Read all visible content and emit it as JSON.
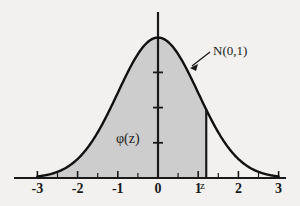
{
  "chart_data": {
    "type": "area",
    "title": "",
    "subtitle": "",
    "xlabel": "",
    "ylabel": "",
    "xlim": [
      -3.45,
      3.45
    ],
    "ylim": [
      0,
      0.47
    ],
    "grid": false,
    "legend": "none",
    "distribution": "standard normal",
    "mean": 0,
    "sd": 1,
    "curve_label": "N(0,1)",
    "density_label": "φ(z)",
    "z_label": "z",
    "z_value": 1.2,
    "shaded_region": {
      "from": -3.45,
      "to": 1.2,
      "meaning": "cumulative probability up to z",
      "color": "#cdcdcd"
    },
    "x_major_ticks": [
      -3,
      -2,
      -1,
      0,
      1,
      2,
      3
    ],
    "x_major_tick_labels": [
      "-3",
      "-2",
      "-1",
      "0",
      "1",
      "2",
      "3"
    ],
    "x_minor_ticks": [
      -2.5,
      -1.5,
      -0.5,
      0.5,
      1.5,
      2.5
    ],
    "y_ticks": [
      0.1,
      0.2,
      0.3
    ],
    "y_tick_labels": [
      "",
      "",
      ""
    ],
    "curve_domain": [
      -3,
      3
    ],
    "curve_points": {
      "x": [
        -3,
        -2.8,
        -2.6,
        -2.4,
        -2.2,
        -2,
        -1.8,
        -1.6,
        -1.4,
        -1.2,
        -1,
        -0.8,
        -0.6,
        -0.4,
        -0.2,
        0,
        0.2,
        0.4,
        0.6,
        0.8,
        1,
        1.2,
        1.4,
        1.6,
        1.8,
        2,
        2.2,
        2.4,
        2.6,
        2.8,
        3
      ],
      "y": [
        0.0044,
        0.0079,
        0.0136,
        0.0224,
        0.0355,
        0.054,
        0.079,
        0.1109,
        0.1497,
        0.1942,
        0.242,
        0.2897,
        0.3332,
        0.3683,
        0.391,
        0.3989,
        0.391,
        0.3683,
        0.3332,
        0.2897,
        0.242,
        0.1942,
        0.1497,
        0.1109,
        0.079,
        0.054,
        0.0355,
        0.0224,
        0.0136,
        0.0079,
        0.0044
      ]
    },
    "colors": {
      "background": "#f2f1ef",
      "axis": "#1a1a1a",
      "curve": "#111111",
      "fill": "#cdcdcd",
      "text": "#1a1a1a"
    }
  },
  "annotations": {
    "curve_callout": "N(0,1)",
    "density": "φ(z)",
    "z_marker": "z"
  }
}
